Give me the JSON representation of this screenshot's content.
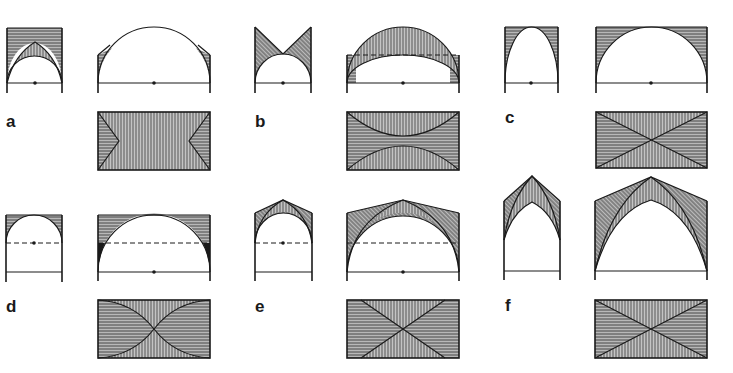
{
  "figure": {
    "stroke_color": "#1a1a1a",
    "hatch_fill_color": "#8a8a8a",
    "background": "#ffffff"
  },
  "panels": [
    {
      "id": "a",
      "label": "a",
      "type": "groin vault variant (pointed transverse rise)",
      "views": [
        "small elevation",
        "large elevation",
        "plan"
      ]
    },
    {
      "id": "b",
      "label": "b",
      "type": "domed / segmental vault",
      "views": [
        "small elevation",
        "large elevation",
        "plan"
      ]
    },
    {
      "id": "c",
      "label": "c",
      "type": "groin vault with elliptical transverse arch",
      "views": [
        "small elevation",
        "large elevation",
        "plan"
      ]
    },
    {
      "id": "d",
      "label": "d",
      "type": "stilted semicircular arch vault",
      "views": [
        "small elevation",
        "large elevation",
        "plan"
      ]
    },
    {
      "id": "e",
      "label": "e",
      "type": "rib vault with raised crown",
      "views": [
        "small elevation",
        "large elevation",
        "plan"
      ]
    },
    {
      "id": "f",
      "label": "f",
      "type": "pointed (Gothic) rib vault",
      "views": [
        "small elevation",
        "large elevation",
        "plan"
      ]
    }
  ]
}
